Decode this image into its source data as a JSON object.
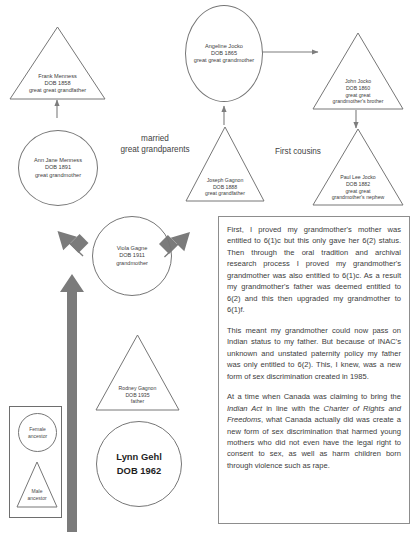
{
  "diagram": {
    "nodes": [
      {
        "id": "frank-menness",
        "shape": "triangle",
        "lines": [
          "Frank Menness",
          "DOB 1858",
          "great great grandfather"
        ]
      },
      {
        "id": "angeline-jocko",
        "shape": "circle",
        "lines": [
          "Angeline Jocko",
          "DOB 1865",
          "great great grandmother"
        ]
      },
      {
        "id": "john-jocko",
        "shape": "triangle",
        "lines": [
          "John Jocko",
          "DOB 1860",
          "great great",
          "grandmother's brother"
        ]
      },
      {
        "id": "ann-jane-menness",
        "shape": "circle",
        "lines": [
          "Ann Jane Menness",
          "DOB 1891",
          "great grandmother"
        ]
      },
      {
        "id": "joseph-gagnon",
        "shape": "triangle",
        "lines": [
          "Joseph Gagnon",
          "DOB 1888",
          "great grandfather"
        ]
      },
      {
        "id": "paul-lee-jocko",
        "shape": "triangle",
        "lines": [
          "Paul Lee Jocko",
          "DOB 1882",
          "great great",
          "grandmother's nephew"
        ]
      },
      {
        "id": "viola-gagne",
        "shape": "circle",
        "lines": [
          "Viola Gagne",
          "DOB 1911",
          "grandmother"
        ]
      },
      {
        "id": "rodney-gagnon",
        "shape": "triangle",
        "lines": [
          "Rodney Gagnon",
          "DOB 1935",
          "father"
        ]
      },
      {
        "id": "lynn-gehl",
        "shape": "circle",
        "lines": [
          "Lynn Gehl",
          "DOB 1962"
        ]
      }
    ],
    "free_labels": [
      {
        "id": "married-great-grandparents",
        "lines": [
          "married",
          "great grandparents"
        ]
      },
      {
        "id": "first-cousins",
        "lines": [
          "First cousins"
        ]
      }
    ],
    "legend": {
      "female": [
        "Female",
        "ancestor"
      ],
      "male": [
        "Male",
        "ancestor"
      ]
    }
  },
  "textbox": {
    "paragraph_1": "First, I proved my grandmother's mother was entitled to 6(1)c but this only gave her 6(2) status. Then through the oral tradition and archival research process I proved my grandmother's grandmother was also entitled to 6(1)c. As a result my grandmother's father was deemed entitled to 6(2) and this then upgraded my grandmother to 6(1)f.",
    "paragraph_2": "This meant my grandmother could now pass on Indian status to my father. But because of INAC's unknown and unstated paternity policy my father was only entitled to 6(2). This, I knew, was a new form of sex discrimination created in 1985.",
    "paragraph_3_part_1": "At a time when Canada was claiming to bring the ",
    "paragraph_3_italic_1": "Indian Act",
    "paragraph_3_part_2": " in line with the ",
    "paragraph_3_italic_2": "Charter of Rights and Freedoms",
    "paragraph_3_part_3": ", what Canada actually did was create a new form of sex discrimination that harmed young mothers who did not even have the legal right to consent to sex, as well as harm children born through violence such as rape."
  },
  "colors": {
    "outline": "#767676",
    "text": "#3c3c3c",
    "thin_arrow": "#7d7d7d",
    "thick_arrow": "#7b7b7b",
    "box_border": "#8d8d8d"
  }
}
